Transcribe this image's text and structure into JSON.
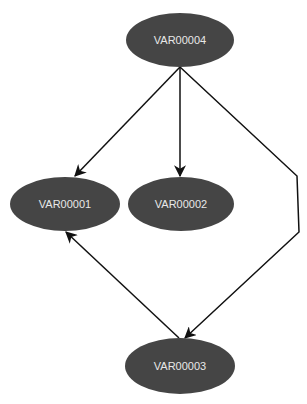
{
  "diagram": {
    "type": "directed-graph",
    "colors": {
      "node_fill": "#454545",
      "node_text": "#e8e8e8",
      "edge": "#111111",
      "background": "#ffffff"
    },
    "nodes": [
      {
        "id": "VAR00004",
        "label": "VAR00004"
      },
      {
        "id": "VAR00001",
        "label": "VAR00001"
      },
      {
        "id": "VAR00002",
        "label": "VAR00002"
      },
      {
        "id": "VAR00003",
        "label": "VAR00003"
      }
    ],
    "edges": [
      {
        "from": "VAR00004",
        "to": "VAR00001"
      },
      {
        "from": "VAR00004",
        "to": "VAR00002"
      },
      {
        "from": "VAR00004",
        "to": "VAR00003"
      },
      {
        "from": "VAR00003",
        "to": "VAR00001"
      }
    ]
  }
}
